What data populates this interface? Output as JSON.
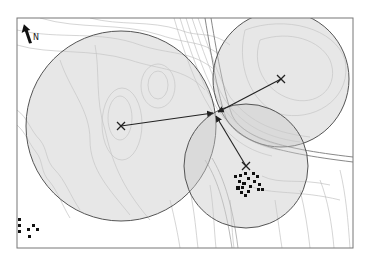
{
  "figure": {
    "type": "trilateration-map",
    "north_label": "N",
    "frame": {
      "x": 17,
      "y": 18,
      "w": 336,
      "h": 230
    },
    "colors": {
      "circle_fill": "#cfcfcf",
      "circle_stroke": "#555555",
      "contour": "#b5b5b5",
      "road": "#8a8a8a",
      "line": "#222222",
      "frame": "#777777"
    },
    "hub": {
      "x": 215,
      "y": 113
    },
    "stations": [
      {
        "id": "station-west",
        "marker": "X",
        "x": 121,
        "y": 126,
        "radius": 95
      },
      {
        "id": "station-northeast",
        "marker": "X",
        "x": 281,
        "y": 79,
        "radius": 68
      },
      {
        "id": "station-south",
        "marker": "X",
        "x": 246,
        "y": 166,
        "radius": 62
      }
    ],
    "settlements": [
      {
        "id": "village-east",
        "note": "cluster of building squares near lower station"
      },
      {
        "id": "village-southwest",
        "note": "small cluster at lower-left edge"
      }
    ]
  }
}
